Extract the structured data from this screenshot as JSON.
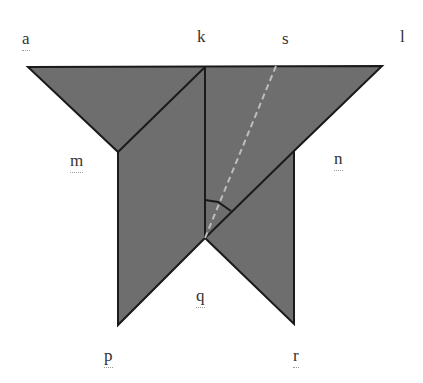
{
  "diagram": {
    "type": "geometry-figure",
    "colors": {
      "fill": "#6e6e6e",
      "stroke": "#1a1a1a",
      "dashed_line": "#bdbdbd",
      "background": "#ffffff"
    },
    "points": {
      "a": [
        28,
        67
      ],
      "k": [
        205,
        67
      ],
      "s": [
        276,
        66
      ],
      "l": [
        382,
        66
      ],
      "m": [
        118,
        152
      ],
      "n": [
        294,
        151
      ],
      "q": [
        205,
        238
      ],
      "p": [
        118,
        325
      ],
      "r": [
        294,
        324
      ]
    },
    "labels": [
      {
        "id": "a",
        "text": "a",
        "x": 22,
        "y": 30,
        "squiggle": true
      },
      {
        "id": "k",
        "text": "k",
        "x": 197,
        "y": 28,
        "squiggle": false
      },
      {
        "id": "s",
        "text": "s",
        "x": 282,
        "y": 30,
        "squiggle": false
      },
      {
        "id": "l",
        "text": "l",
        "x": 400,
        "y": 28,
        "squiggle": false
      },
      {
        "id": "m",
        "text": "m",
        "x": 70,
        "y": 152,
        "squiggle": true
      },
      {
        "id": "n",
        "text": "n",
        "x": 334,
        "y": 150,
        "squiggle": true
      },
      {
        "id": "q",
        "text": "q",
        "x": 196,
        "y": 287,
        "squiggle": true
      },
      {
        "id": "p",
        "text": "p",
        "x": 104,
        "y": 347,
        "squiggle": true
      },
      {
        "id": "r",
        "text": "r",
        "x": 293,
        "y": 347,
        "squiggle": true
      }
    ],
    "segments": [
      {
        "from": "a",
        "to": "l",
        "style": "solid"
      },
      {
        "from": "a",
        "to": "m",
        "style": "solid"
      },
      {
        "from": "m",
        "to": "k",
        "style": "solid"
      },
      {
        "from": "k",
        "to": "q",
        "style": "solid"
      },
      {
        "from": "q",
        "to": "l",
        "style": "solid"
      },
      {
        "from": "m",
        "to": "p",
        "style": "solid"
      },
      {
        "from": "p",
        "to": "q",
        "style": "solid"
      },
      {
        "from": "q",
        "to": "r",
        "style": "solid"
      },
      {
        "from": "r",
        "to": "n",
        "style": "solid"
      },
      {
        "from": "s",
        "to": "q",
        "style": "dashed"
      }
    ],
    "angle_mark": {
      "vertex": "q",
      "between": [
        "k",
        "l"
      ],
      "radius": 38
    }
  }
}
